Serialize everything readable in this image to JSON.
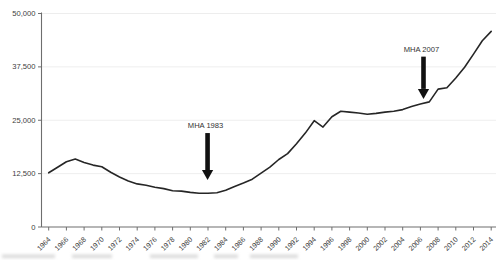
{
  "page": {
    "background_color": "#ffffff",
    "title": ""
  },
  "chart_data": {
    "type": "line",
    "title": "",
    "xlabel": "",
    "ylabel": "",
    "legend": "none",
    "grid": "faint-horizontal",
    "line_color": "#262626",
    "axis_color": "#6e6e6e",
    "label_color": "#3d3d3d",
    "annotation_color": "#111111",
    "xlim": [
      1964,
      2014
    ],
    "ylim": [
      0,
      50000
    ],
    "yticks": [
      0,
      12500,
      25000,
      37500,
      50000
    ],
    "ytick_labels": [
      "0",
      "12,500",
      "25,000",
      "37,500",
      "50,000"
    ],
    "xticks": [
      1964,
      1966,
      1968,
      1970,
      1972,
      1974,
      1976,
      1978,
      1980,
      1982,
      1984,
      1986,
      1988,
      1990,
      1992,
      1994,
      1996,
      1998,
      2000,
      2002,
      2004,
      2006,
      2008,
      2010,
      2012,
      2014
    ],
    "xtick_labels": [
      "1964",
      "1966",
      "1968",
      "1970",
      "1972",
      "1974",
      "1976",
      "1978",
      "1980",
      "1982",
      "1984",
      "1986",
      "1988",
      "1990",
      "1992",
      "1994",
      "1996",
      "1998",
      "2000",
      "2002",
      "2004",
      "2006",
      "2008",
      "2010",
      "2012",
      "2014"
    ],
    "x": [
      1964,
      1965,
      1966,
      1967,
      1968,
      1969,
      1970,
      1971,
      1972,
      1973,
      1974,
      1975,
      1976,
      1977,
      1978,
      1979,
      1980,
      1981,
      1982,
      1983,
      1984,
      1985,
      1986,
      1987,
      1988,
      1989,
      1990,
      1991,
      1992,
      1993,
      1994,
      1995,
      1996,
      1997,
      1998,
      1999,
      2000,
      2001,
      2002,
      2003,
      2004,
      2005,
      2006,
      2007,
      2008,
      2009,
      2010,
      2011,
      2012,
      2013,
      2014
    ],
    "values": [
      12700,
      14000,
      15300,
      15900,
      15100,
      14500,
      14100,
      12800,
      11700,
      10800,
      10100,
      9800,
      9300,
      9000,
      8500,
      8400,
      8100,
      7900,
      7900,
      8000,
      8600,
      9500,
      10300,
      11200,
      12600,
      14000,
      15800,
      17200,
      19500,
      22000,
      24900,
      23400,
      25800,
      27100,
      26900,
      26700,
      26400,
      26600,
      26900,
      27100,
      27500,
      28200,
      28800,
      29300,
      32300,
      32600,
      34900,
      37400,
      40500,
      43600,
      45800
    ],
    "annotations": [
      {
        "label": "MHA 1983",
        "year": 1981.95,
        "tip_value": 11000,
        "top_value": 22000
      },
      {
        "label": "MHA 2007",
        "year": 2006.35,
        "tip_value": 30000,
        "top_value": 39900
      }
    ]
  }
}
